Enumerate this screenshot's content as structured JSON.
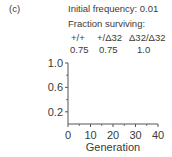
{
  "panel_label": "(c)",
  "annotation": {
    "initial_frequency": "Initial frequency: 0.01",
    "fraction_title": "Fraction surviving:",
    "genotypes": [
      "+/+",
      "+/Δ32",
      "Δ32/Δ32"
    ],
    "fractions": [
      "0.75",
      "0.75",
      "1.0"
    ]
  },
  "chart_data": {
    "type": "line",
    "title": "",
    "xlabel": "Generation",
    "ylabel": "",
    "xlim": [
      0,
      40
    ],
    "ylim": [
      0,
      1.0
    ],
    "xticks": [
      0,
      10,
      20,
      30,
      40
    ],
    "xtick_labels": [
      "0",
      "10",
      "20",
      "30",
      "40"
    ],
    "yticks": [
      0.2,
      0.6,
      1.0
    ],
    "ytick_labels": [
      "0.2",
      "0.6",
      "1.0"
    ],
    "y_minor_ticks": [
      0.4,
      0.8
    ],
    "x_minor_ticks": [
      5,
      15,
      25,
      35
    ],
    "series": [],
    "grid": false,
    "legend": "none"
  }
}
